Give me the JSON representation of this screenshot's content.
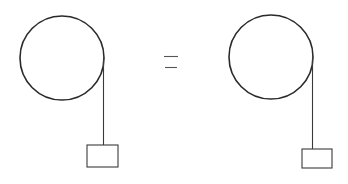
{
  "diagram": {
    "stroke_color": "#2a2a2a",
    "background": "#ffffff",
    "left_system": {
      "pulley": {
        "cx": 62,
        "cy": 58,
        "r": 42
      },
      "string": {
        "x": 103.5,
        "y1": 58,
        "y2": 145
      },
      "mass": {
        "x": 87,
        "y": 145,
        "width": 31,
        "height": 22
      }
    },
    "equals_sign": {
      "symbol": "=",
      "top_line": {
        "x1": 164,
        "x2": 178,
        "y": 56.5
      },
      "bottom_line": {
        "x1": 165,
        "x2": 177,
        "y": 67.5
      }
    },
    "right_system": {
      "pulley": {
        "cx": 271,
        "cy": 57,
        "r": 42
      },
      "string": {
        "x": 312.5,
        "y1": 57,
        "y2": 149
      },
      "mass": {
        "x": 302,
        "y": 149,
        "width": 30,
        "height": 19
      }
    }
  }
}
